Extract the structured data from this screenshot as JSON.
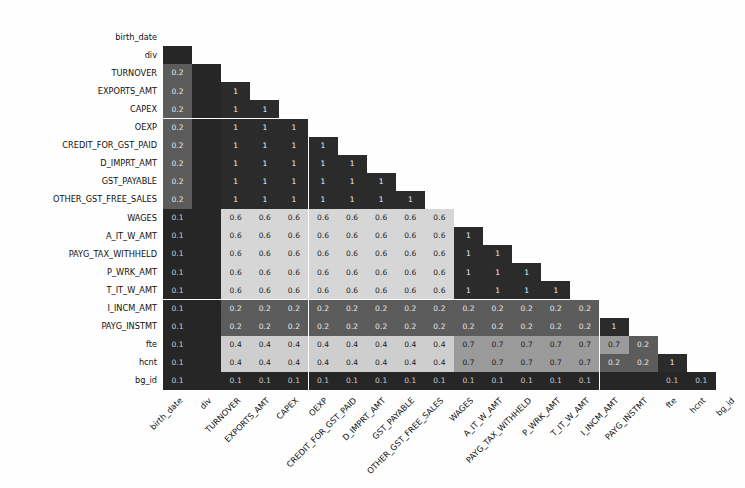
{
  "chart_data": {
    "type": "heatmap",
    "title": "",
    "subtitle": "",
    "xlabel": "",
    "ylabel": "",
    "colormap": "grayscale",
    "grid": false,
    "legend": "none",
    "triangular": "lower",
    "annotated": true,
    "value_format": "1 decimal",
    "vmin": 0,
    "vmax": 1,
    "categories": [
      "birth_date",
      "div",
      "TURNOVER",
      "EXPORTS_AMT",
      "CAPEX",
      "OEXP",
      "CREDIT_FOR_GST_PAID",
      "D_IMPRT_AMT",
      "GST_PAYABLE",
      "OTHER_GST_FREE_SALES",
      "WAGES",
      "A_IT_W_AMT",
      "PAYG_TAX_WITHHELD",
      "P_WRK_AMT",
      "T_IT_W_AMT",
      "I_INCM_AMT",
      "PAYG_INSTMT",
      "fte",
      "hcnt",
      "bg_id"
    ],
    "x_tick_labels": [
      "birth_date",
      "div",
      "TURNOVER",
      "EXPORTS_AMT",
      "CAPEX",
      "OEXP",
      "CREDIT_FOR_GST_PAID",
      "D_IMPRT_AMT",
      "GST_PAYABLE",
      "OTHER_GST_FREE_SALES",
      "WAGES",
      "A_IT_W_AMT",
      "PAYG_TAX_WITHHELD",
      "P_WRK_AMT",
      "T_IT_W_AMT",
      "I_INCM_AMT",
      "PAYG_INSTMT",
      "fte",
      "hcnt",
      "bg_id"
    ],
    "y_tick_labels": [
      "birth_date",
      "div",
      "TURNOVER",
      "EXPORTS_AMT",
      "CAPEX",
      "OEXP",
      "CREDIT_FOR_GST_PAID",
      "D_IMPRT_AMT",
      "GST_PAYABLE",
      "OTHER_GST_FREE_SALES",
      "WAGES",
      "A_IT_W_AMT",
      "PAYG_TAX_WITHHELD",
      "P_WRK_AMT",
      "T_IT_W_AMT",
      "I_INCM_AMT",
      "PAYG_INSTMT",
      "fte",
      "hcnt",
      "bg_id"
    ],
    "note": "Lower-triangular matrix. rows[i][j] is the annotated value at row i, column j; null means the cell is masked/blank (upper triangle). Unlabeled dark cells are drawn but carry no printed annotation.",
    "rows": [
      [
        null,
        null,
        null,
        null,
        null,
        null,
        null,
        null,
        null,
        null,
        null,
        null,
        null,
        null,
        null,
        null,
        null,
        null,
        null,
        null
      ],
      [
        "",
        null,
        null,
        null,
        null,
        null,
        null,
        null,
        null,
        null,
        null,
        null,
        null,
        null,
        null,
        null,
        null,
        null,
        null,
        null
      ],
      [
        "0.2",
        "",
        null,
        null,
        null,
        null,
        null,
        null,
        null,
        null,
        null,
        null,
        null,
        null,
        null,
        null,
        null,
        null,
        null,
        null
      ],
      [
        "0.2",
        "",
        "1",
        null,
        null,
        null,
        null,
        null,
        null,
        null,
        null,
        null,
        null,
        null,
        null,
        null,
        null,
        null,
        null,
        null
      ],
      [
        "0.2",
        "",
        "1",
        "1",
        null,
        null,
        null,
        null,
        null,
        null,
        null,
        null,
        null,
        null,
        null,
        null,
        null,
        null,
        null,
        null
      ],
      [
        "0.2",
        "",
        "1",
        "1",
        "1",
        null,
        null,
        null,
        null,
        null,
        null,
        null,
        null,
        null,
        null,
        null,
        null,
        null,
        null,
        null
      ],
      [
        "0.2",
        "",
        "1",
        "1",
        "1",
        "1",
        null,
        null,
        null,
        null,
        null,
        null,
        null,
        null,
        null,
        null,
        null,
        null,
        null,
        null
      ],
      [
        "0.2",
        "",
        "1",
        "1",
        "1",
        "1",
        "1",
        null,
        null,
        null,
        null,
        null,
        null,
        null,
        null,
        null,
        null,
        null,
        null,
        null
      ],
      [
        "0.2",
        "",
        "1",
        "1",
        "1",
        "1",
        "1",
        "1",
        null,
        null,
        null,
        null,
        null,
        null,
        null,
        null,
        null,
        null,
        null,
        null
      ],
      [
        "0.2",
        "",
        "1",
        "1",
        "1",
        "1",
        "1",
        "1",
        "1",
        null,
        null,
        null,
        null,
        null,
        null,
        null,
        null,
        null,
        null,
        null
      ],
      [
        "0.1",
        "",
        "0.6",
        "0.6",
        "0.6",
        "0.6",
        "0.6",
        "0.6",
        "0.6",
        "0.6",
        null,
        null,
        null,
        null,
        null,
        null,
        null,
        null,
        null,
        null
      ],
      [
        "0.1",
        "",
        "0.6",
        "0.6",
        "0.6",
        "0.6",
        "0.6",
        "0.6",
        "0.6",
        "0.6",
        "1",
        null,
        null,
        null,
        null,
        null,
        null,
        null,
        null,
        null
      ],
      [
        "0.1",
        "",
        "0.6",
        "0.6",
        "0.6",
        "0.6",
        "0.6",
        "0.6",
        "0.6",
        "0.6",
        "1",
        "1",
        null,
        null,
        null,
        null,
        null,
        null,
        null,
        null
      ],
      [
        "0.1",
        "",
        "0.6",
        "0.6",
        "0.6",
        "0.6",
        "0.6",
        "0.6",
        "0.6",
        "0.6",
        "1",
        "1",
        "1",
        null,
        null,
        null,
        null,
        null,
        null,
        null
      ],
      [
        "0.1",
        "",
        "0.6",
        "0.6",
        "0.6",
        "0.6",
        "0.6",
        "0.6",
        "0.6",
        "0.6",
        "1",
        "1",
        "1",
        "1",
        null,
        null,
        null,
        null,
        null,
        null
      ],
      [
        "0.1",
        "",
        "0.2",
        "0.2",
        "0.2",
        "0.2",
        "0.2",
        "0.2",
        "0.2",
        "0.2",
        "0.2",
        "0.2",
        "0.2",
        "0.2",
        "0.2",
        null,
        null,
        null,
        null,
        null
      ],
      [
        "0.1",
        "",
        "0.2",
        "0.2",
        "0.2",
        "0.2",
        "0.2",
        "0.2",
        "0.2",
        "0.2",
        "0.2",
        "0.2",
        "0.2",
        "0.2",
        "0.2",
        "1",
        null,
        null,
        null,
        null
      ],
      [
        "0.1",
        "",
        "0.4",
        "0.4",
        "0.4",
        "0.4",
        "0.4",
        "0.4",
        "0.4",
        "0.4",
        "0.7",
        "0.7",
        "0.7",
        "0.7",
        "0.7",
        "0.7",
        "0.2",
        null,
        null,
        null
      ],
      [
        "0.1",
        "",
        "0.4",
        "0.4",
        "0.4",
        "0.4",
        "0.4",
        "0.4",
        "0.4",
        "0.4",
        "0.7",
        "0.7",
        "0.7",
        "0.7",
        "0.7",
        "0.2",
        "0.2",
        "1",
        null,
        null
      ],
      [
        "0.1",
        "",
        "0.1",
        "0.1",
        "0.1",
        "0.1",
        "0.1",
        "0.1",
        "0.1",
        "0.1",
        "0.1",
        "0.1",
        "0.1",
        "0.1",
        "0.1",
        "",
        "",
        "0.1",
        "0.1",
        null
      ]
    ],
    "value_colors": {
      "1": "#2b2b2b",
      "0.7": "#9b9b9b",
      "0.6": "#d7d7d7",
      "0.4": "#cfcfcf",
      "0.2": "#5c5c5c",
      "0.1": "#262626",
      "": "#262626"
    },
    "text_colors": {
      "1": "#f2f2f2",
      "0.7": "#1a1a1a",
      "0.6": "#1a1a1a",
      "0.4": "#1a1a1a",
      "0.2": "#e8e8e8",
      "0.1": "#cfcfcf",
      "": "#262626"
    },
    "background": "#ffffff"
  }
}
